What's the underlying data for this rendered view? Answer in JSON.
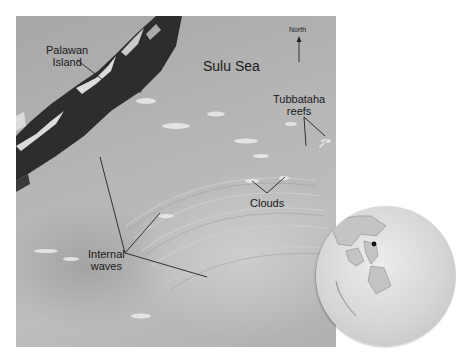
{
  "figure": {
    "type": "satellite-photo",
    "colors": {
      "sea": "#b3b3b3",
      "land": "#2e2e2e",
      "cloud": "#f2f2f2",
      "leader_line": "#222222",
      "text": "#1a1a1a",
      "globe": "#d8d8d8"
    },
    "labels": {
      "palawan_line1": "Palawan",
      "palawan_line2": "Island",
      "sulu_sea": "Sulu Sea",
      "north": "North",
      "tubbataha_line1": "Tubbataha",
      "tubbataha_line2": "reefs",
      "clouds": "Clouds",
      "internal_waves_line1": "Internal",
      "internal_waves_line2": "waves"
    },
    "icons": {
      "north_arrow": "north-arrow-icon",
      "globe": "globe-inset-icon"
    }
  }
}
